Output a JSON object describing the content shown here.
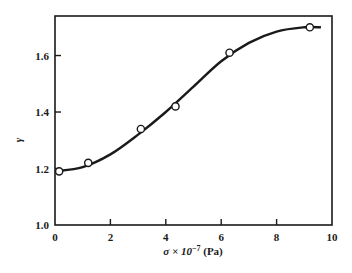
{
  "chart_data": {
    "type": "line",
    "title": "",
    "xlabel": "σ × 10⁻⁷ (Pa)",
    "ylabel": "γ",
    "xlim": [
      0,
      10
    ],
    "ylim": [
      1.0,
      1.74
    ],
    "x_ticks": [
      "0",
      "2",
      "4",
      "6",
      "8",
      "10"
    ],
    "y_ticks": [
      "1.0",
      "1.2",
      "1.4",
      "1.6"
    ],
    "grid": false,
    "legend": null,
    "series": [
      {
        "name": "measured",
        "marker": "open-circle",
        "x": [
          0.15,
          1.2,
          3.1,
          4.35,
          6.3,
          9.2
        ],
        "y": [
          1.19,
          1.22,
          1.34,
          1.42,
          1.61,
          1.7
        ]
      },
      {
        "name": "fitted curve",
        "marker": "none",
        "x": [
          0,
          1,
          2,
          3,
          4,
          5,
          6,
          7,
          8,
          9,
          9.6
        ],
        "y": [
          1.19,
          1.205,
          1.25,
          1.32,
          1.4,
          1.49,
          1.58,
          1.645,
          1.685,
          1.7,
          1.7
        ]
      }
    ]
  },
  "labels": {
    "xlabel_sigma": "σ × 10",
    "xlabel_exp": "−7",
    "xlabel_unit": " (Pa)",
    "ylabel": "γ"
  }
}
